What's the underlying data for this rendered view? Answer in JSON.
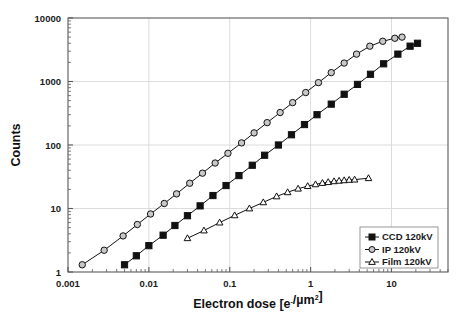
{
  "chart_data": {
    "type": "line",
    "title": "",
    "subtitle": "",
    "xlabel": "Electron dose [e-/µm2]",
    "xlabel_parts": {
      "main": "Electron dose [e",
      "sup1": "-",
      "mid": "/µm",
      "sup2": "2",
      "end": "]"
    },
    "ylabel": "Counts",
    "xscale": "log",
    "yscale": "log",
    "xlim": [
      0.001,
      50
    ],
    "ylim": [
      1,
      10000
    ],
    "xticks": [
      0.001,
      0.01,
      0.1,
      1,
      10
    ],
    "xtick_labels": [
      "0.001",
      "0.01",
      "0.1",
      "1",
      "10"
    ],
    "yticks": [
      1,
      10,
      100,
      1000,
      10000
    ],
    "ytick_labels": [
      "1",
      "10",
      "100",
      "1000",
      "10000"
    ],
    "grid": "major-both",
    "legend_position": "bottom-right",
    "series": [
      {
        "name": "CCD 120kV",
        "marker": "filled-square",
        "color": "#111111",
        "fill": "#111111",
        "x": [
          0.005,
          0.007,
          0.01,
          0.015,
          0.021,
          0.03,
          0.043,
          0.062,
          0.09,
          0.13,
          0.19,
          0.27,
          0.4,
          0.58,
          0.84,
          1.2,
          1.8,
          2.6,
          3.8,
          5.5,
          8.0,
          12.0,
          17.0,
          21.0
        ],
        "y": [
          1.3,
          1.8,
          2.6,
          3.8,
          5.4,
          7.7,
          11,
          16,
          23,
          33,
          48,
          69,
          100,
          145,
          210,
          300,
          440,
          630,
          900,
          1300,
          1900,
          2700,
          3600,
          4000
        ]
      },
      {
        "name": "IP 120kV",
        "marker": "open-circle",
        "color": "#111111",
        "fill": "#c8c8c8",
        "x": [
          0.0015,
          0.0028,
          0.0048,
          0.0072,
          0.0105,
          0.0155,
          0.022,
          0.032,
          0.046,
          0.066,
          0.095,
          0.14,
          0.2,
          0.29,
          0.42,
          0.6,
          0.87,
          1.25,
          1.8,
          2.6,
          3.7,
          5.4,
          7.8,
          11.0,
          13.5
        ],
        "y": [
          1.3,
          2.2,
          3.7,
          5.6,
          8.2,
          12,
          17,
          25,
          36,
          52,
          74,
          108,
          155,
          225,
          325,
          465,
          670,
          960,
          1380,
          1950,
          2700,
          3600,
          4300,
          4800,
          5000
        ]
      },
      {
        "name": "Film 120kV",
        "marker": "open-triangle",
        "color": "#111111",
        "fill": "#ffffff",
        "x": [
          0.03,
          0.048,
          0.075,
          0.115,
          0.175,
          0.26,
          0.38,
          0.52,
          0.7,
          0.92,
          1.15,
          1.4,
          1.65,
          1.95,
          2.25,
          2.6,
          3.0,
          3.5,
          5.2
        ],
        "y": [
          3.4,
          4.5,
          6.0,
          7.8,
          10.0,
          12.5,
          15.5,
          18.0,
          20.5,
          22.5,
          24.0,
          25.2,
          26.0,
          26.8,
          27.3,
          27.8,
          28.2,
          28.5,
          30.0
        ]
      }
    ]
  },
  "legend": {
    "items": [
      {
        "label": "CCD 120kV",
        "marker": "filled-square"
      },
      {
        "label": "IP 120kV",
        "marker": "open-circle"
      },
      {
        "label": "Film 120kV",
        "marker": "open-triangle"
      }
    ]
  },
  "colors": {
    "axis": "#5a5a5a",
    "grid": "#dcdcdc",
    "text": "#1a1a1a",
    "series_line": "#111111",
    "ip_fill": "#c8c8c8",
    "legend_border": "#8c8c8c"
  }
}
